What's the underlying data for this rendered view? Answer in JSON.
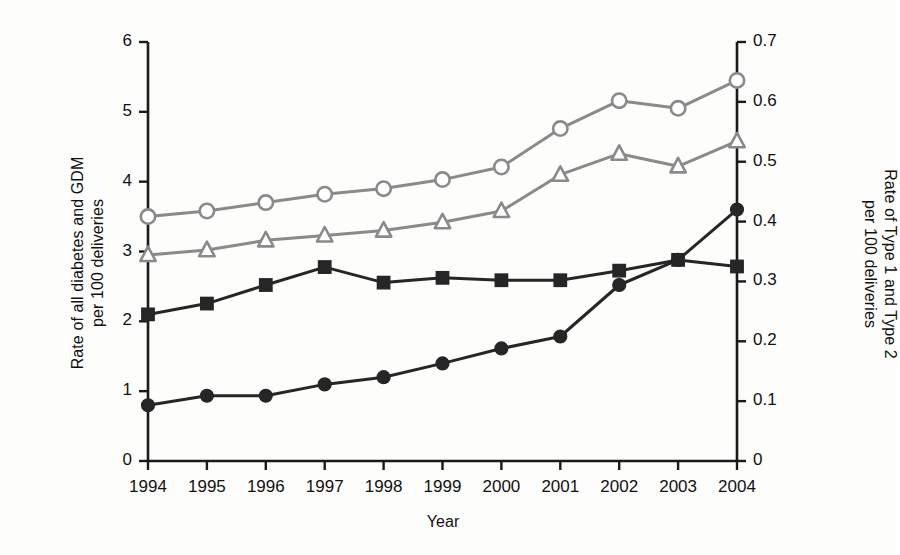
{
  "chart_data": {
    "type": "line",
    "title": "",
    "xlabel": "Year",
    "ylabel": "Rate of all diabetes and GDM\nper 100 deliveries",
    "ylabel_right": "Rate of Type 1 and Type 2\nper 100 deliveries",
    "categories": [
      "1994",
      "1995",
      "1996",
      "1997",
      "1998",
      "1999",
      "2000",
      "2001",
      "2002",
      "2003",
      "2004"
    ],
    "ylim": [
      0,
      6
    ],
    "yticks": [
      "0",
      "1",
      "2",
      "3",
      "4",
      "5",
      "6"
    ],
    "ylim_right": [
      0,
      0.7
    ],
    "yticks_right": [
      "0",
      "0.1",
      "0.2",
      "0.3",
      "0.4",
      "0.5",
      "0.6",
      "0.7"
    ],
    "grid": false,
    "legend": "none",
    "series": [
      {
        "name": "all-diabetes-open-circle",
        "marker": "open-circle",
        "color": "#8a8a8a",
        "axis": "left",
        "values": [
          3.5,
          3.58,
          3.7,
          3.82,
          3.9,
          4.03,
          4.21,
          4.76,
          5.16,
          5.05,
          5.45
        ]
      },
      {
        "name": "gdm-open-triangle",
        "marker": "open-triangle",
        "color": "#8a8a8a",
        "axis": "left",
        "values": [
          2.95,
          3.02,
          3.16,
          3.23,
          3.3,
          3.42,
          3.58,
          4.1,
          4.4,
          4.22,
          4.58
        ]
      },
      {
        "name": "type-2-filled-square",
        "marker": "filled-square",
        "color": "#262626",
        "axis": "right",
        "values": [
          0.245,
          0.263,
          0.294,
          0.324,
          0.298,
          0.306,
          0.302,
          0.302,
          0.318,
          0.336,
          0.325
        ]
      },
      {
        "name": "type-1-filled-circle",
        "marker": "filled-circle",
        "color": "#262626",
        "axis": "right",
        "values": [
          0.093,
          0.109,
          0.109,
          0.128,
          0.14,
          0.163,
          0.188,
          0.208,
          0.294,
          0.336,
          0.42
        ]
      }
    ]
  },
  "axes": {
    "x_tick_labels": [
      "1994",
      "1995",
      "1996",
      "1997",
      "1998",
      "1999",
      "2000",
      "2001",
      "2002",
      "2003",
      "2004"
    ],
    "y_left_tick_labels": [
      "6",
      "5",
      "4",
      "3",
      "2",
      "1",
      "0"
    ],
    "y_right_tick_labels": [
      "0.7",
      "0.6",
      "0.5",
      "0.4",
      "0.3",
      "0.2",
      "0.1",
      "0"
    ],
    "x_axis_title": "Year",
    "y_left_axis_title": "Rate of all diabetes and GDM\nper 100 deliveries",
    "y_right_axis_title": "Rate of Type 1 and Type 2\nper 100 deliveries"
  },
  "colors": {
    "gray_series": "#8a8a8a",
    "dark_series": "#262626",
    "axis": "#1a1a1a",
    "background": "#fdfdfc"
  }
}
